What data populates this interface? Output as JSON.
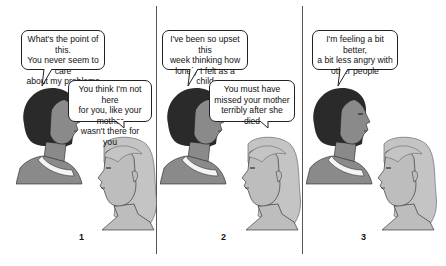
{
  "panels": [
    {
      "number": "1",
      "bubbles": [
        {
          "speaker": "client",
          "text": "What's the point of this.\nYou never seem to care\nabout my problems"
        },
        {
          "speaker": "therapist",
          "text": "You think I'm not here\nfor you, like your mother\nwasn't there for you"
        }
      ]
    },
    {
      "number": "2",
      "bubbles": [
        {
          "speaker": "client",
          "text": "I've been so upset this\nweek thinking how\nlonely I felt as a child"
        },
        {
          "speaker": "therapist",
          "text": "You must have\nmissed your mother\nterribly after she died"
        }
      ]
    },
    {
      "number": "3",
      "bubbles": [
        {
          "speaker": "client",
          "text": "I'm feeling a bit better,\na bit less angry with\nother people"
        }
      ]
    }
  ],
  "colors": {
    "dark_hair": "#2a2a2a",
    "dark_skin": "#8a8a8a",
    "light_hair": "#c4c4c4",
    "light_skin": "#bdbdbd",
    "outline": "#222222"
  }
}
